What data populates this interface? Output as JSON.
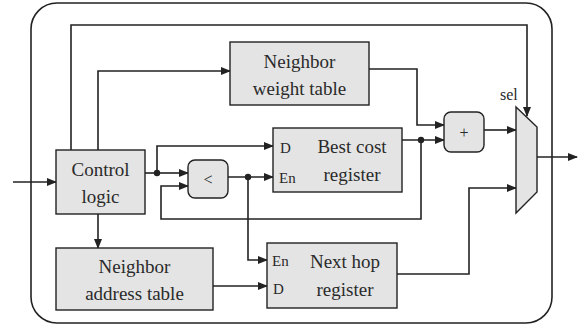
{
  "diagram": {
    "colors": {
      "block_fill": "#e4e4e4",
      "stroke": "#222222",
      "background": "#ffffff"
    },
    "blocks": {
      "control_logic": {
        "line1": "Control",
        "line2": "logic"
      },
      "neighbor_weight_table": {
        "line1": "Neighbor",
        "line2": "weight table"
      },
      "best_cost_register": {
        "port_d": "D",
        "port_en": "En",
        "line1": "Best cost",
        "line2": "register"
      },
      "comparator": {
        "symbol": "<"
      },
      "adder": {
        "symbol": "+"
      },
      "neighbor_address_table": {
        "line1": "Neighbor",
        "line2": "address table"
      },
      "next_hop_register": {
        "port_en": "En",
        "port_d": "D",
        "line1": "Next hop",
        "line2": "register"
      },
      "mux": {
        "select_label": "sel"
      }
    }
  }
}
